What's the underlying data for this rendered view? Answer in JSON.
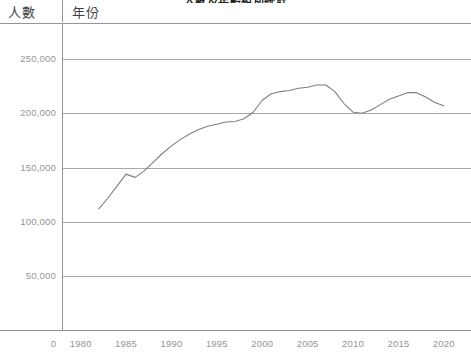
{
  "header": {
    "people_label": "人數",
    "year_label": "年份",
    "title_fragment": "人數及年齡組別統計"
  },
  "colors": {
    "line": "#7c7f85",
    "grid": "#a7a9ac",
    "axis": "#939598",
    "tick_text": "#939598",
    "header_text": "#414042",
    "background": "#ffffff"
  },
  "chart_data": {
    "type": "line",
    "title": "人數及年齡組別統計",
    "xlabel": "年份",
    "ylabel": "人數",
    "xlim": [
      1978,
      2022
    ],
    "ylim": [
      0,
      275000
    ],
    "grid": true,
    "legend": null,
    "x_ticks": [
      1980,
      1985,
      1990,
      1995,
      2000,
      2005,
      2010,
      2015,
      2020
    ],
    "y_ticks": [
      0,
      50000,
      100000,
      150000,
      200000,
      250000
    ],
    "y_tick_labels": [
      "0",
      "50,000",
      "100,000",
      "150,000",
      "200,000",
      "250,000"
    ],
    "x": [
      1982,
      1983,
      1984,
      1985,
      1986,
      1987,
      1988,
      1989,
      1990,
      1991,
      1992,
      1993,
      1994,
      1995,
      1996,
      1997,
      1998,
      1999,
      2000,
      2001,
      2002,
      2003,
      2004,
      2005,
      2006,
      2007,
      2008,
      2009,
      2010,
      2011,
      2012,
      2013,
      2014,
      2015,
      2016,
      2017,
      2018,
      2019,
      2020
    ],
    "values": [
      112000,
      122000,
      133000,
      144000,
      141000,
      147000,
      155000,
      163000,
      170000,
      176000,
      181000,
      185000,
      188000,
      190000,
      192000,
      192500,
      195000,
      201000,
      212000,
      218000,
      220000,
      221000,
      223000,
      224000,
      226000,
      226000,
      220000,
      209000,
      201000,
      200000,
      203000,
      208000,
      213000,
      216000,
      219000,
      219000,
      215000,
      210000,
      207000
    ],
    "series_name": "人數"
  }
}
